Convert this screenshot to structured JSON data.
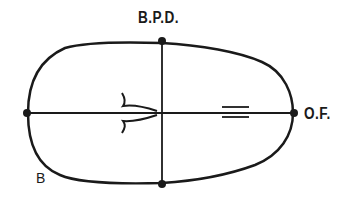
{
  "diagram": {
    "labels": {
      "bpd": "B.P.D.",
      "of": "O.F.",
      "b": "B"
    },
    "colors": {
      "stroke": "#1a1a1a",
      "background": "#ffffff"
    }
  }
}
